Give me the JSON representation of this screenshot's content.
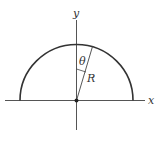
{
  "diagram": {
    "axis_labels": {
      "x": "x",
      "y": "y"
    },
    "angle_label": "θ",
    "radius_label": "R",
    "colors": {
      "stroke": "#333333",
      "axis": "#555555",
      "background": "#ffffff"
    },
    "shape": "semicircle"
  }
}
